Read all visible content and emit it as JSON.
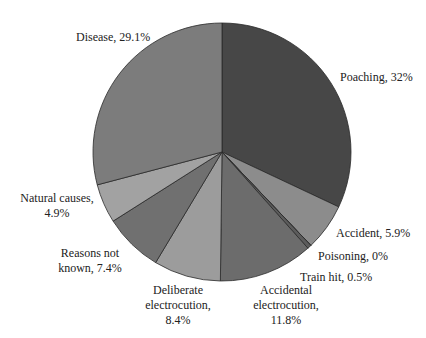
{
  "chart_data": {
    "type": "pie",
    "title": "",
    "start_angle_deg": 0,
    "direction": "clockwise",
    "center": [
      222,
      152
    ],
    "radius": 129,
    "slices": [
      {
        "label": "Poaching",
        "value": 32,
        "display": "Poaching, 32%",
        "color": "#474747"
      },
      {
        "label": "Accident",
        "value": 5.9,
        "display": "Accident, 5.9%",
        "color": "#8c8c8c"
      },
      {
        "label": "Poisoning",
        "value": 0,
        "display": "Poisoning, 0%",
        "color": "#5a5a5a"
      },
      {
        "label": "Train hit",
        "value": 0.5,
        "display": "Train hit, 0.5%",
        "color": "#5c5c5c"
      },
      {
        "label": "Accidental electrocution",
        "value": 11.8,
        "display": "Accidental electrocution, 11.8%",
        "color": "#6c6c6c"
      },
      {
        "label": "Deliberate electrocution",
        "value": 8.4,
        "display": "Deliberate electrocution, 8.4%",
        "color": "#9c9c9c"
      },
      {
        "label": "Reasons not known",
        "value": 7.4,
        "display": "Reasons not known, 7.4%",
        "color": "#707070"
      },
      {
        "label": "Natural causes",
        "value": 4.9,
        "display": "Natural causes, 4.9%",
        "color": "#a2a2a2"
      },
      {
        "label": "Disease",
        "value": 29.1,
        "display": "Disease, 29.1%",
        "color": "#7c7c7c"
      }
    ],
    "legend": "none",
    "data_labels": "outside"
  },
  "labels": {
    "poaching": "Poaching, 32%",
    "accident": "Accident, 5.9%",
    "poisoning": "Poisoning, 0%",
    "train_hit": "Train hit, 0.5%",
    "accidental_1": "Accidental",
    "accidental_2": "electrocution,",
    "accidental_3": "11.8%",
    "deliberate_1": "Deliberate",
    "deliberate_2": "electrocution,",
    "deliberate_3": "8.4%",
    "reasons_1": "Reasons not",
    "reasons_2": "known, 7.4%",
    "natural_1": "Natural causes,",
    "natural_2": "4.9%",
    "disease": "Disease, 29.1%"
  }
}
